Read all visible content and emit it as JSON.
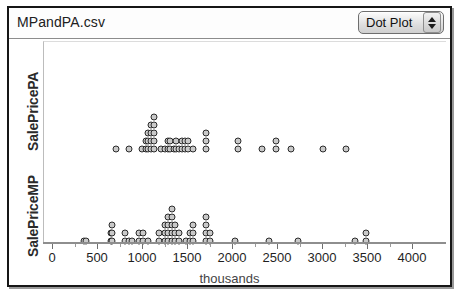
{
  "window": {
    "title": "MPandPA.csv"
  },
  "toolbar": {
    "plot_type_label": "Dot Plot",
    "stepper_up_icon": "triangle-up-icon",
    "stepper_down_icon": "triangle-down-icon"
  },
  "chart_data": {
    "type": "scatter",
    "title": "MPandPA.csv",
    "xlabel": "thousands",
    "ylabel": "",
    "xlim": [
      0,
      4200
    ],
    "xticks": [
      0,
      500,
      1000,
      1500,
      2000,
      2500,
      3000,
      3500,
      4000
    ],
    "xticklabels": [
      "0",
      "500",
      "1000",
      "1500",
      "2000",
      "2500",
      "3000",
      "3500",
      "4000"
    ],
    "grid": false,
    "legend": "none",
    "panels": [
      {
        "name": "SalePricePA",
        "axis_label": "SalePricePA",
        "values": [
          700,
          840,
          990,
          1030,
          1050,
          1060,
          1080,
          1090,
          1110,
          1120,
          1130,
          1200,
          1240,
          1280,
          1300,
          1340,
          1370,
          1400,
          1430,
          1450,
          1470,
          1500,
          1520,
          1550,
          1700,
          1740,
          2060,
          2100,
          2320,
          2480,
          2520,
          2640,
          2670,
          2700,
          3000,
          3260
        ],
        "stack_counts": {
          "700": 1,
          "840": 1,
          "990": 1,
          "1030": 2,
          "1060": 3,
          "1090": 4,
          "1120": 5,
          "1200": 1,
          "1240": 1,
          "1280": 2,
          "1300": 2,
          "1340": 1,
          "1370": 2,
          "1400": 1,
          "1430": 2,
          "1470": 2,
          "1500": 2,
          "1550": 1,
          "1700": 3,
          "2060": 2,
          "2320": 1,
          "2480": 2,
          "2640": 1,
          "3000": 1,
          "3260": 1
        }
      },
      {
        "name": "SalePriceMP",
        "axis_label": "SalePriceMP",
        "values": [
          340,
          370,
          640,
          660,
          680,
          800,
          840,
          880,
          900,
          960,
          980,
          1000,
          1020,
          1050,
          1180,
          1200,
          1240,
          1260,
          1280,
          1300,
          1320,
          1340,
          1360,
          1380,
          1400,
          1420,
          1480,
          1520,
          1560,
          1600,
          1660,
          1700,
          1720,
          1740,
          2020,
          2400,
          2720,
          3360,
          3480,
          3500
        ],
        "stack_counts": {
          "340": 1,
          "370": 1,
          "640": 2,
          "660": 3,
          "800": 2,
          "840": 1,
          "880": 1,
          "960": 2,
          "1000": 2,
          "1050": 1,
          "1180": 2,
          "1240": 3,
          "1280": 4,
          "1320": 5,
          "1360": 3,
          "1400": 2,
          "1480": 1,
          "1520": 2,
          "1560": 3,
          "1700": 4,
          "1740": 2,
          "2020": 1,
          "2400": 1,
          "2720": 1,
          "3360": 1,
          "3480": 2
        }
      }
    ]
  },
  "axis": {
    "x_title": "thousands"
  }
}
